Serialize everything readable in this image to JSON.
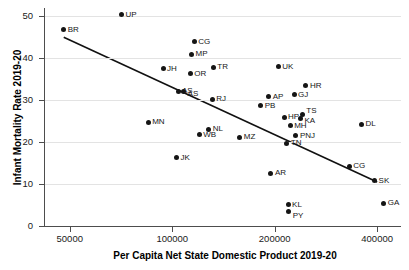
{
  "chart": {
    "title": "",
    "xlabel": "Per Capita Net State Domestic Product 2019-20",
    "ylabel": "Infant Mortality Rate 2019-20"
  },
  "axes": {
    "y_ticks": [
      "0",
      "10",
      "20",
      "30",
      "40",
      "50"
    ],
    "x_ticks": [
      "50000",
      "100000",
      "200000",
      "400000"
    ]
  },
  "chart_data": {
    "type": "scatter",
    "title": "",
    "xlabel": "Per Capita Net State Domestic Product 2019-20",
    "ylabel": "Infant Mortality Rate 2019-20",
    "xscale": "log",
    "yscale": "linear",
    "xlim": [
      42000,
      470000
    ],
    "ylim": [
      0,
      52
    ],
    "x_ticks": [
      50000,
      100000,
      200000,
      400000
    ],
    "y_ticks": [
      0,
      10,
      20,
      30,
      40,
      50
    ],
    "grid": "horizontal",
    "legend": "none",
    "point_label_field": "label",
    "points": [
      {
        "label": "BR",
        "x": 48000,
        "y": 46.8
      },
      {
        "label": "UP",
        "x": 71000,
        "y": 50.4
      },
      {
        "label": "CG",
        "x": 116000,
        "y": 44.0
      },
      {
        "label": "MP",
        "x": 114000,
        "y": 41.0
      },
      {
        "label": "JH",
        "x": 94000,
        "y": 37.5
      },
      {
        "label": "OR",
        "x": 113000,
        "y": 36.3
      },
      {
        "label": "TR",
        "x": 132000,
        "y": 37.9
      },
      {
        "label": "UK",
        "x": 205000,
        "y": 38.0
      },
      {
        "label": "AS",
        "x": 104000,
        "y": 32.2
      },
      {
        "label": "AS2",
        "x": 108000,
        "y": 32.0
      },
      {
        "label": "RJ",
        "x": 131000,
        "y": 30.2
      },
      {
        "label": "HR",
        "x": 247000,
        "y": 33.5
      },
      {
        "label": "GJ",
        "x": 228000,
        "y": 31.3
      },
      {
        "label": "AP",
        "x": 192000,
        "y": 30.8
      },
      {
        "label": "PB",
        "x": 182000,
        "y": 28.7
      },
      {
        "label": "MN",
        "x": 85000,
        "y": 24.8
      },
      {
        "label": "NL",
        "x": 128000,
        "y": 23.1
      },
      {
        "label": "WB",
        "x": 120000,
        "y": 21.8
      },
      {
        "label": "MZ",
        "x": 158000,
        "y": 21.2
      },
      {
        "label": "HP",
        "x": 213000,
        "y": 26.0
      },
      {
        "label": "TS",
        "x": 241000,
        "y": 26.7
      },
      {
        "label": "KA",
        "x": 238000,
        "y": 25.6
      },
      {
        "label": "MH",
        "x": 222000,
        "y": 23.9
      },
      {
        "label": "PNJ",
        "x": 231000,
        "y": 21.6
      },
      {
        "label": "TN",
        "x": 217000,
        "y": 19.7
      },
      {
        "label": "DL",
        "x": 360000,
        "y": 24.3
      },
      {
        "label": "JK",
        "x": 103000,
        "y": 16.3
      },
      {
        "label": "CG2",
        "x": 331000,
        "y": 14.2
      },
      {
        "label": "AR",
        "x": 195000,
        "y": 12.6
      },
      {
        "label": "SK",
        "x": 393000,
        "y": 10.8
      },
      {
        "label": "KL",
        "x": 219000,
        "y": 5.1
      },
      {
        "label": "PY",
        "x": 220000,
        "y": 3.4
      },
      {
        "label": "GA",
        "x": 418000,
        "y": 5.4
      }
    ],
    "trendline": {
      "type": "linear-fit-on-log-x",
      "x_start": 48000,
      "y_start": 45.0,
      "x_end": 400000,
      "y_end": 10.5
    }
  }
}
